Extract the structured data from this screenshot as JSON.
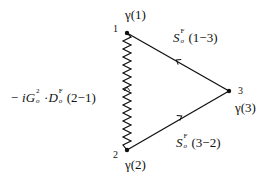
{
  "diagram": {
    "type": "feynman-triangle",
    "vertices": [
      {
        "id": "1",
        "label": "1",
        "factor": "γ(1)",
        "x": 127,
        "y": 33
      },
      {
        "id": "2",
        "label": "2",
        "factor": "γ(2)",
        "x": 127,
        "y": 150
      },
      {
        "id": "3",
        "label": "3",
        "factor": "γ(3)",
        "x": 229,
        "y": 91
      }
    ],
    "edges": [
      {
        "from": "3",
        "to": "1",
        "style": "solid-arrow",
        "label": {
          "symbol": "S",
          "sup": "F",
          "sub": "o",
          "arg": "(1−3)"
        }
      },
      {
        "from": "2",
        "to": "3",
        "style": "solid-arrow",
        "label": {
          "symbol": "S",
          "sup": "F",
          "sub": "o",
          "arg": "(3−2)"
        }
      },
      {
        "from": "2",
        "to": "1",
        "style": "wavy",
        "label": {
          "prefix": "− i",
          "G": "G",
          "G_sup": "2",
          "G_sub": "o",
          "dot": "·",
          "D": "D",
          "D_sup": "F",
          "D_sub": "o",
          "arg": "(2−1)"
        }
      }
    ],
    "colors": {
      "line": "#111111",
      "background": "#ffffff"
    }
  }
}
